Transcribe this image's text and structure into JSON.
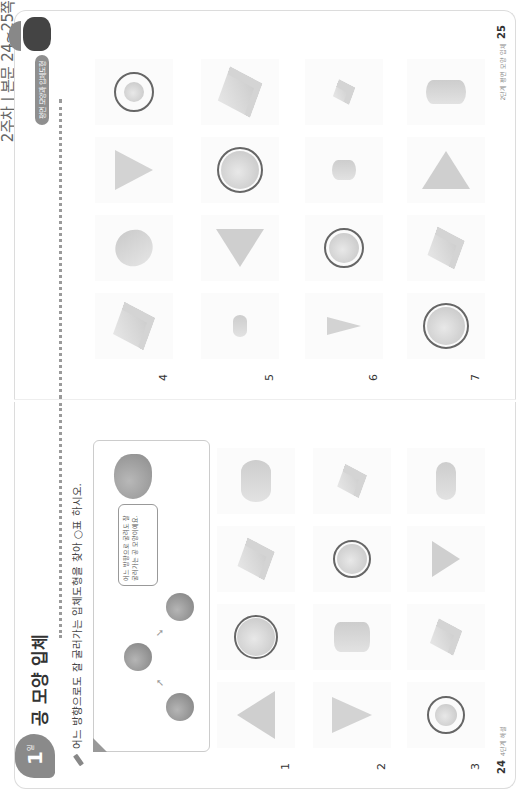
{
  "header": {
    "strip_text": "2주차 | 본문 24~25쪽"
  },
  "left_page": {
    "badge": {
      "number": "1",
      "sub": "일"
    },
    "title": "공 모양 입체",
    "instruction": "어느 방향으로도 잘 굴러가는 입체도형을 찾아 ○표 하시오.",
    "example": {
      "bubble_text": "어느 방향으로 굴려도 잘 굴러가는 공 모양이에요."
    },
    "rows": [
      {
        "number": "1",
        "shapes": [
          "pyramid",
          "sphere",
          "cube",
          "cylinder"
        ],
        "circled_index": 1
      },
      {
        "number": "2",
        "shapes": [
          "cone",
          "cylinder",
          "sphere",
          "cube"
        ],
        "circled_index": 2
      },
      {
        "number": "3",
        "shapes": [
          "sphere-small",
          "cube",
          "pyramid",
          "cylinder-tall"
        ],
        "circled_index": 0
      }
    ],
    "footer": {
      "page_number": "24",
      "label": "4단계 해설"
    }
  },
  "right_page": {
    "tag": "평면 모양과 입체도형",
    "rows": [
      {
        "number": "4",
        "shapes": [
          "cube",
          "cylinder",
          "cone",
          "sphere-small"
        ],
        "circled_index": 3
      },
      {
        "number": "5",
        "shapes": [
          "disc",
          "pyramid",
          "sphere",
          "cube"
        ],
        "circled_index": 2
      },
      {
        "number": "6",
        "shapes": [
          "cone-side",
          "sphere",
          "cylinder-small",
          "cube-small"
        ],
        "circled_index": 1
      },
      {
        "number": "7",
        "shapes": [
          "sphere",
          "cube",
          "pyramid",
          "cylinder"
        ],
        "circled_index": 0
      }
    ],
    "footer": {
      "page_number": "25",
      "label": "2단계 평면 모양 입체"
    }
  }
}
